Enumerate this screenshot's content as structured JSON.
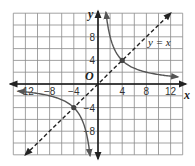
{
  "chart_data": {
    "type": "line",
    "title": "",
    "xlabel": "x",
    "ylabel": "y",
    "origin_label": "O",
    "xlim": [
      -14,
      14
    ],
    "ylim": [
      -12,
      12
    ],
    "grid": true,
    "grid_step": 2,
    "x_ticks": [
      -12,
      -8,
      -4,
      4,
      8,
      12
    ],
    "x_tick_labels": [
      "−12",
      "−8",
      "−4",
      "4",
      "8",
      "12"
    ],
    "y_ticks": [
      8,
      4,
      -4,
      -8
    ],
    "y_tick_labels": [
      "8",
      "4",
      "−4",
      "−8"
    ],
    "series": [
      {
        "name": "y = 16/x",
        "style": "solid",
        "color": "#555555",
        "points_q1": [
          [
            1.3,
            12.3
          ],
          [
            2,
            8
          ],
          [
            4,
            4
          ],
          [
            8,
            2
          ],
          [
            13,
            1.23
          ]
        ],
        "points_q3": [
          [
            -13,
            -1.23
          ],
          [
            -8,
            -2
          ],
          [
            -4,
            -4
          ],
          [
            -2,
            -8
          ],
          [
            -1.3,
            -12.3
          ]
        ]
      },
      {
        "name": "y = x",
        "style": "dashed",
        "color": "#222222",
        "points": [
          [
            -12,
            -12
          ],
          [
            12,
            12
          ]
        ]
      }
    ],
    "marked_points": [
      [
        4,
        4
      ],
      [
        -4,
        -4
      ]
    ],
    "annotations": [
      {
        "text": "y = x",
        "x": 9,
        "y": 7
      }
    ]
  }
}
